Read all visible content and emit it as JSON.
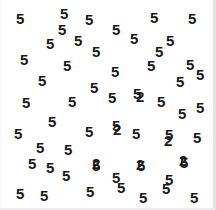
{
  "task": {
    "type": "visual-search",
    "target_character": "2",
    "distractor_character": "5",
    "target_count": 6,
    "distractor_count": 54,
    "total_items": 60,
    "background_color": "#ffffff",
    "glyph_color": "#181818",
    "border_color": "#e3e3e3"
  },
  "canvas": {
    "width": 216,
    "height": 210
  },
  "items": [
    {
      "char": "5",
      "x": 16,
      "y": 11
    },
    {
      "char": "5",
      "x": 58,
      "y": 22
    },
    {
      "char": "5",
      "x": 60,
      "y": 6
    },
    {
      "char": "5",
      "x": 85,
      "y": 12
    },
    {
      "char": "5",
      "x": 112,
      "y": 22
    },
    {
      "char": "5",
      "x": 150,
      "y": 10
    },
    {
      "char": "5",
      "x": 188,
      "y": 11
    },
    {
      "char": "5",
      "x": 46,
      "y": 36
    },
    {
      "char": "5",
      "x": 74,
      "y": 33
    },
    {
      "char": "5",
      "x": 130,
      "y": 31
    },
    {
      "char": "5",
      "x": 166,
      "y": 33
    },
    {
      "char": "5",
      "x": 20,
      "y": 52
    },
    {
      "char": "5",
      "x": 92,
      "y": 44
    },
    {
      "char": "5",
      "x": 63,
      "y": 58
    },
    {
      "char": "5",
      "x": 147,
      "y": 58
    },
    {
      "char": "5",
      "x": 186,
      "y": 57
    },
    {
      "char": "5",
      "x": 38,
      "y": 73
    },
    {
      "char": "5",
      "x": 111,
      "y": 64
    },
    {
      "char": "5",
      "x": 90,
      "y": 80
    },
    {
      "char": "5",
      "x": 176,
      "y": 74
    },
    {
      "char": "5",
      "x": 133,
      "y": 86
    },
    {
      "char": "2",
      "x": 134,
      "y": 86
    },
    {
      "char": "5",
      "x": 22,
      "y": 95
    },
    {
      "char": "5",
      "x": 68,
      "y": 94
    },
    {
      "char": "5",
      "x": 108,
      "y": 90
    },
    {
      "char": "5",
      "x": 157,
      "y": 94
    },
    {
      "char": "5",
      "x": 178,
      "y": 106
    },
    {
      "char": "5",
      "x": 48,
      "y": 114
    },
    {
      "char": "5",
      "x": 112,
      "y": 118
    },
    {
      "char": "5",
      "x": 14,
      "y": 126
    },
    {
      "char": "5",
      "x": 85,
      "y": 124
    },
    {
      "char": "5",
      "x": 132,
      "y": 126
    },
    {
      "char": "5",
      "x": 165,
      "y": 127
    },
    {
      "char": "5",
      "x": 193,
      "y": 130
    },
    {
      "char": "5",
      "x": 36,
      "y": 140
    },
    {
      "char": "5",
      "x": 64,
      "y": 142
    },
    {
      "char": "5",
      "x": 92,
      "y": 158
    },
    {
      "char": "5",
      "x": 28,
      "y": 156
    },
    {
      "char": "5",
      "x": 137,
      "y": 158
    },
    {
      "char": "5",
      "x": 180,
      "y": 155
    },
    {
      "char": "5",
      "x": 62,
      "y": 168
    },
    {
      "char": "5",
      "x": 112,
      "y": 170
    },
    {
      "char": "5",
      "x": 165,
      "y": 172
    },
    {
      "char": "5",
      "x": 16,
      "y": 186
    },
    {
      "char": "5",
      "x": 40,
      "y": 188
    },
    {
      "char": "5",
      "x": 86,
      "y": 184
    },
    {
      "char": "5",
      "x": 117,
      "y": 180
    },
    {
      "char": "5",
      "x": 139,
      "y": 190
    },
    {
      "char": "5",
      "x": 162,
      "y": 181
    },
    {
      "char": "5",
      "x": 190,
      "y": 190
    }
  ],
  "targets": [
    {
      "char": "2",
      "x": 136,
      "y": 89
    },
    {
      "char": "2",
      "x": 113,
      "y": 122
    },
    {
      "char": "2",
      "x": 164,
      "y": 133
    },
    {
      "char": "2",
      "x": 92,
      "y": 156
    },
    {
      "char": "2",
      "x": 136,
      "y": 157
    },
    {
      "char": "2",
      "x": 179,
      "y": 153
    }
  ],
  "distractors_extra": [
    {
      "char": "5",
      "x": 155,
      "y": 44
    },
    {
      "char": "5",
      "x": 196,
      "y": 67
    },
    {
      "char": "5",
      "x": 46,
      "y": 160
    },
    {
      "char": "5",
      "x": 196,
      "y": 100
    }
  ]
}
